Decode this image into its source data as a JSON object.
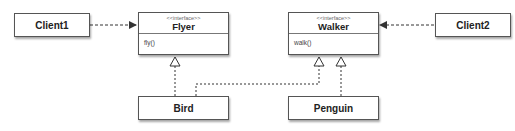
{
  "diagram": {
    "classes": [
      {
        "id": "client1",
        "name": "Client1"
      },
      {
        "id": "client2",
        "name": "Client2"
      },
      {
        "id": "bird",
        "name": "Bird"
      },
      {
        "id": "penguin",
        "name": "Penguin"
      }
    ],
    "interfaces": [
      {
        "id": "flyer",
        "stereotype": "<<interface>>",
        "name": "Flyer",
        "methods": [
          "fly()"
        ]
      },
      {
        "id": "walker",
        "stereotype": "<<interface>>",
        "name": "Walker",
        "methods": [
          "walk()"
        ]
      }
    ],
    "relationships": [
      {
        "from": "Client1",
        "to": "Flyer",
        "type": "dependency"
      },
      {
        "from": "Client2",
        "to": "Walker",
        "type": "dependency"
      },
      {
        "from": "Bird",
        "to": "Flyer",
        "type": "realization"
      },
      {
        "from": "Bird",
        "to": "Walker",
        "type": "realization"
      },
      {
        "from": "Penguin",
        "to": "Walker",
        "type": "realization"
      }
    ],
    "colors": {
      "border": "#555555",
      "line": "#333333",
      "background": "#ffffff"
    }
  }
}
